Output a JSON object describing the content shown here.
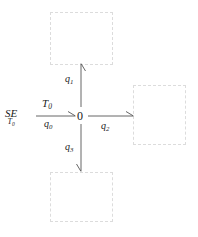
{
  "diagram": {
    "kind": "signal-flow-diagram",
    "canvas": {
      "width": 198,
      "height": 237,
      "background": "#ffffff"
    },
    "stroke_color": "#555555",
    "dash_color": "#dcdcdc",
    "center_node": {
      "label": "0"
    },
    "source": {
      "main_label": "SE",
      "sub_label": "T",
      "sub_label_subscript": "0"
    },
    "edges": [
      {
        "name": "input-edge",
        "direction": "right",
        "label_above": "T",
        "label_above_sub": "0",
        "label_below": "q",
        "label_below_sub": "0"
      },
      {
        "name": "up-edge",
        "direction": "up",
        "label": "q",
        "label_sub": "1"
      },
      {
        "name": "right-edge",
        "direction": "right",
        "label": "q",
        "label_sub": "2"
      },
      {
        "name": "down-edge",
        "direction": "down",
        "label": "q",
        "label_sub": "3"
      }
    ],
    "placeholder_boxes": [
      {
        "name": "box-top",
        "content": ""
      },
      {
        "name": "box-right",
        "content": ""
      },
      {
        "name": "box-bottom",
        "content": ""
      }
    ]
  }
}
